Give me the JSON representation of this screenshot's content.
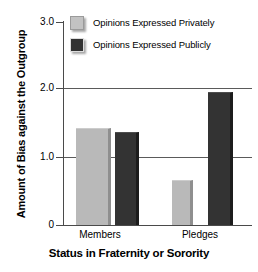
{
  "chart_data": {
    "type": "bar",
    "title": "",
    "xlabel": "Status in Fraternity or Sorority",
    "ylabel": "Amount of Bias against the Outgroup",
    "categories": [
      "Members",
      "Pledges"
    ],
    "series": [
      {
        "name": "Opinions Expressed Privately",
        "color": "#b9b9b9",
        "values": [
          1.44,
          0.66
        ]
      },
      {
        "name": "Opinions Expressed Publicly",
        "color": "#333333",
        "values": [
          1.37,
          1.97
        ]
      }
    ],
    "ylim": [
      0,
      3.0
    ],
    "yticks": [
      0,
      1.0,
      2.0,
      3.0
    ],
    "ytick_labels": [
      "0",
      "1.0",
      "2.0",
      "3.0"
    ],
    "grid": "horizontal",
    "gridlines_at": [
      1.0,
      2.0
    ],
    "legend_position": "top-left-inside"
  },
  "legend": {
    "items": [
      {
        "label": "Opinions Expressed Privately",
        "swatch": "light"
      },
      {
        "label": "Opinions Expressed Publicly",
        "swatch": "dark"
      }
    ]
  },
  "axes": {
    "y_title": "Amount of Bias against the Outgroup",
    "x_title": "Status in Fraternity or Sorority",
    "y_labels": [
      "3.0",
      "2.0",
      "1.0",
      "0"
    ],
    "x_labels": [
      "Members",
      "Pledges"
    ]
  }
}
